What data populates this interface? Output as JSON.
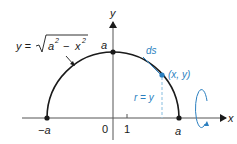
{
  "colors": {
    "ink": "#1a1a1a",
    "accent": "#2b7fc0",
    "dashed": "#9cc9e4",
    "axis": "#555555"
  },
  "axes": {
    "x_label": "x",
    "y_label": "y",
    "origin_label": "0",
    "tick_one_label": "1"
  },
  "points": {
    "neg_a_label": "−a",
    "pos_a_label": "a",
    "top_a_label": "a",
    "point_label": "(x, y)"
  },
  "equation": {
    "lhs": "y =",
    "radicand_a": "a",
    "radicand_a_exp": "2",
    "minus": "−",
    "radicand_x": "x",
    "radicand_x_exp": "2"
  },
  "annotations": {
    "arc_length": "ds",
    "radius": "r = y"
  },
  "icons": {
    "rotation": "rotation-about-x-axis-icon"
  }
}
